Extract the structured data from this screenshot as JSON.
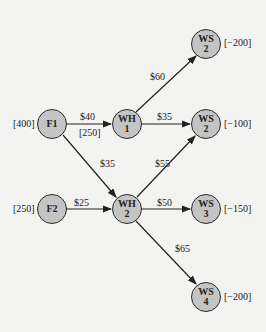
{
  "nodes": {
    "f1": {
      "label": "F1",
      "supply": "[400]"
    },
    "f2": {
      "label": "F2",
      "supply": "[250]"
    },
    "wh1": {
      "line1": "WH",
      "line2": "1"
    },
    "wh2": {
      "line1": "WH",
      "line2": "2"
    },
    "ws_top": {
      "line1": "WS",
      "line2": "2",
      "demand": "[−200]"
    },
    "ws_mid": {
      "line1": "WS",
      "line2": "2",
      "demand": "[−100]"
    },
    "ws3": {
      "line1": "WS",
      "line2": "3",
      "demand": "[−150]"
    },
    "ws4": {
      "line1": "WS",
      "line2": "4",
      "demand": "[−200]"
    }
  },
  "edges": {
    "f1_wh1": {
      "cost": "$40",
      "capacity": "[250]"
    },
    "f1_wh2": {
      "cost": "$35"
    },
    "f2_wh2": {
      "cost": "$25"
    },
    "wh1_wstop": {
      "cost": "$60"
    },
    "wh1_wsmid": {
      "cost": "$35"
    },
    "wh2_wsmid": {
      "cost": "$55"
    },
    "wh2_ws3": {
      "cost": "$50"
    },
    "wh2_ws4": {
      "cost": "$65"
    }
  }
}
